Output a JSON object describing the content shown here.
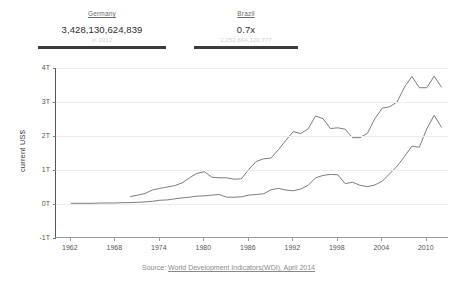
{
  "stats": [
    {
      "name": "Germany",
      "value": "3,428,130,624,839",
      "sub": "in 2012",
      "key": "germany"
    },
    {
      "name": "Brazil",
      "value": "0.7x",
      "sub": "2,252,664,120,777",
      "key": "brazil"
    }
  ],
  "source": {
    "prefix": "Source:",
    "link": "World Development Indicators(WDI), April 2014"
  },
  "chart_data": {
    "type": "line",
    "title": "",
    "xlabel": "",
    "ylabel": "current US$",
    "xlim": [
      1960,
      2013
    ],
    "ylim": [
      -1,
      4
    ],
    "yticks": [
      "4T",
      "3T",
      "2T",
      "1T",
      "0T",
      "-1T"
    ],
    "ytick_values": [
      4,
      3,
      2,
      1,
      0,
      -1
    ],
    "xticks": [
      1962,
      1968,
      1974,
      1980,
      1986,
      1992,
      1998,
      2004,
      2010
    ],
    "grid": true,
    "legend": "none",
    "units": "trillions of current US$",
    "series": [
      {
        "name": "Germany",
        "color": "#6e6e6e",
        "x": [
          1970,
          1971,
          1972,
          1973,
          1974,
          1975,
          1976,
          1977,
          1978,
          1979,
          1980,
          1981,
          1982,
          1983,
          1984,
          1985,
          1986,
          1987,
          1988,
          1989,
          1990,
          1991,
          1992,
          1993,
          1994,
          1995,
          1996,
          1997,
          1998,
          1999,
          2000,
          2001,
          2002,
          2003,
          2004,
          2005,
          2006,
          2007,
          2008,
          2009,
          2010,
          2011,
          2012
        ],
        "y": [
          0.22,
          0.26,
          0.31,
          0.41,
          0.46,
          0.5,
          0.54,
          0.62,
          0.77,
          0.9,
          0.95,
          0.79,
          0.77,
          0.77,
          0.73,
          0.74,
          1.02,
          1.25,
          1.33,
          1.35,
          1.6,
          1.87,
          2.13,
          2.07,
          2.21,
          2.59,
          2.51,
          2.22,
          2.24,
          2.2,
          1.95,
          1.95,
          2.08,
          2.51,
          2.82,
          2.86,
          3.0,
          3.44,
          3.75,
          3.42,
          3.42,
          3.76,
          3.43
        ]
      },
      {
        "name": "Brazil",
        "color": "#6e6e6e",
        "x": [
          1962,
          1963,
          1964,
          1965,
          1966,
          1967,
          1968,
          1969,
          1970,
          1971,
          1972,
          1973,
          1974,
          1975,
          1976,
          1977,
          1978,
          1979,
          1980,
          1981,
          1982,
          1983,
          1984,
          1985,
          1986,
          1987,
          1988,
          1989,
          1990,
          1991,
          1992,
          1993,
          1994,
          1995,
          1996,
          1997,
          1998,
          1999,
          2000,
          2001,
          2002,
          2003,
          2004,
          2005,
          2006,
          2007,
          2008,
          2009,
          2010,
          2011,
          2012
        ],
        "y": [
          0.02,
          0.02,
          0.02,
          0.02,
          0.03,
          0.03,
          0.03,
          0.04,
          0.04,
          0.05,
          0.06,
          0.08,
          0.11,
          0.12,
          0.15,
          0.18,
          0.2,
          0.23,
          0.24,
          0.26,
          0.28,
          0.2,
          0.2,
          0.21,
          0.26,
          0.28,
          0.3,
          0.42,
          0.46,
          0.41,
          0.39,
          0.44,
          0.55,
          0.77,
          0.84,
          0.87,
          0.86,
          0.6,
          0.64,
          0.55,
          0.51,
          0.56,
          0.67,
          0.89,
          1.11,
          1.4,
          1.7,
          1.67,
          2.21,
          2.61,
          2.25
        ]
      }
    ]
  }
}
